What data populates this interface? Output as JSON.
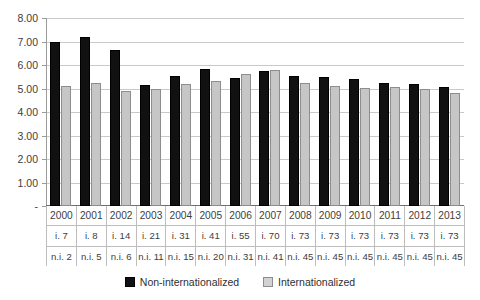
{
  "chart_data": {
    "type": "bar",
    "title": "",
    "xlabel": "",
    "ylabel": "",
    "ylim": [
      0,
      8
    ],
    "grid": true,
    "legend_position": "bottom",
    "categories": [
      "2000",
      "2001",
      "2002",
      "2003",
      "2004",
      "2005",
      "2006",
      "2007",
      "2008",
      "2009",
      "2010",
      "2011",
      "2012",
      "2013"
    ],
    "ytick_labels": [
      "-",
      "1.00",
      "2.00",
      "3.00",
      "4.00",
      "5.00",
      "6.00",
      "7.00",
      "8.00"
    ],
    "ytick_values": [
      0,
      1,
      2,
      3,
      4,
      5,
      6,
      7,
      8
    ],
    "series": [
      {
        "name": "Non-internationalized",
        "color": "#111111",
        "values": [
          7.0,
          7.2,
          6.65,
          5.15,
          5.55,
          5.85,
          5.45,
          5.75,
          5.55,
          5.5,
          5.4,
          5.25,
          5.2,
          5.05
        ]
      },
      {
        "name": "Internationalized",
        "color": "#c6c6c6",
        "values": [
          5.12,
          5.22,
          4.9,
          4.97,
          5.18,
          5.3,
          5.62,
          5.77,
          5.25,
          5.1,
          5.03,
          5.07,
          4.97,
          4.82
        ]
      }
    ],
    "category_sublabels": [
      {
        "key": "internationalized_count",
        "values": [
          "i. 7",
          "i. 8",
          "i. 14",
          "i. 21",
          "i. 31",
          "i. 41",
          "i. 55",
          "i. 70",
          "i. 73",
          "i. 73",
          "i. 73",
          "i. 73",
          "i. 73",
          "i. 73"
        ]
      },
      {
        "key": "non_internationalized_count",
        "values": [
          "n.i. 2",
          "n.i. 5",
          "n.i. 6",
          "n.i. 11",
          "n.i. 15",
          "n.i. 20",
          "n.i. 31",
          "n.i. 41",
          "n.i. 45",
          "n.i. 45",
          "n.i. 45",
          "n.i. 45",
          "n.i. 45",
          "n.i. 45"
        ]
      }
    ]
  },
  "legend": {
    "items": [
      {
        "label": "Non-internationalized",
        "marker": "filled-square-black"
      },
      {
        "label": "Internationalized",
        "marker": "outlined-square-gray"
      }
    ]
  }
}
